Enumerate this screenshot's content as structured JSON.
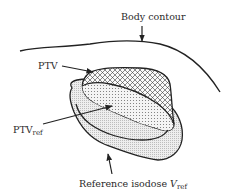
{
  "diagram": {
    "type": "radiotherapy target volume schematic",
    "labels": {
      "body_contour": "Body contour",
      "ptv": "PTV",
      "ptv_ref_main": "PTV",
      "ptv_ref_sub": "ref",
      "ref_isodose_main": "Reference isodose ",
      "ref_isodose_var": "V",
      "ref_isodose_sub": "ref"
    },
    "regions": [
      {
        "name": "PTV",
        "fill": "crosshatch"
      },
      {
        "name": "PTV_ref",
        "fill": "dots",
        "description": "overlap of PTV and reference isodose volume"
      },
      {
        "name": "Reference isodose V_ref",
        "fill": "fine stipple"
      }
    ],
    "colors": {
      "line": "#222222",
      "stipple": "#dcdcdc",
      "background": "#ffffff"
    }
  }
}
